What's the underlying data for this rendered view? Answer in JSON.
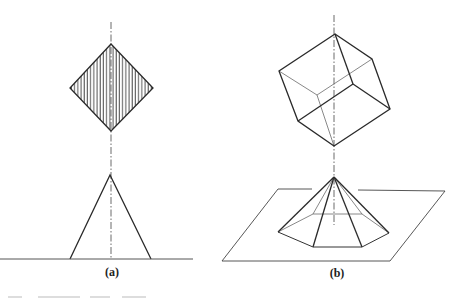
{
  "figure": {
    "panels": [
      {
        "id": "a",
        "label": "(a)",
        "description": "Hatched square (rhombus) projected above a cone/triangle resting on a ground line, with vertical dash-dot axis",
        "shapes": {
          "diamond": {
            "top": [
              111,
              44
            ],
            "left": [
              70,
              88
            ],
            "bottom": [
              111,
              131
            ],
            "right": [
              153,
              88
            ],
            "fill": "vertical-hatch"
          },
          "triangle": {
            "apex": [
              110,
              175
            ],
            "base_left": [
              70,
              259
            ],
            "base_right": [
              151,
              259
            ]
          },
          "ground_line": {
            "x1": 0,
            "x2": 193,
            "y": 259
          },
          "axis": {
            "x": 111,
            "y1": 22,
            "y2": 258
          }
        }
      },
      {
        "id": "b",
        "label": "(b)",
        "description": "Wireframe cube above a hexagonal pyramid standing on an inclined plane, with vertical dash-dot axis",
        "shapes": {
          "cube": {
            "outer": [
              [
                335,
                34
              ],
              [
                372,
                59
              ],
              [
                390,
                109
              ],
              [
                334,
                146
              ],
              [
                298,
                121
              ],
              [
                279,
                71
              ]
            ],
            "front_vertex": [
              353,
              84
            ],
            "back_vertex": [
              317,
              95
            ]
          },
          "pyramid": {
            "apex": [
              334,
              177
            ],
            "base_front": [
              [
                278,
                232
              ],
              [
                313,
                247
              ],
              [
                362,
                247
              ],
              [
                389,
                233
              ]
            ],
            "base_back": [
              [
                313,
                214
              ],
              [
                362,
                214
              ]
            ]
          },
          "plane": {
            "top_left": [
              278,
              189
            ],
            "top_right": [
              445,
              191
            ],
            "bottom_right": [
              390,
              261
            ],
            "bottom_left": [
              222,
              261
            ]
          },
          "axis": {
            "x": 334,
            "y1": 15,
            "y2": 225
          }
        }
      }
    ],
    "colors": {
      "line": "#2a2a2a",
      "hidden_line": "#6a6a6a",
      "hatch": "#3a3a3a",
      "background": "#ffffff"
    }
  }
}
